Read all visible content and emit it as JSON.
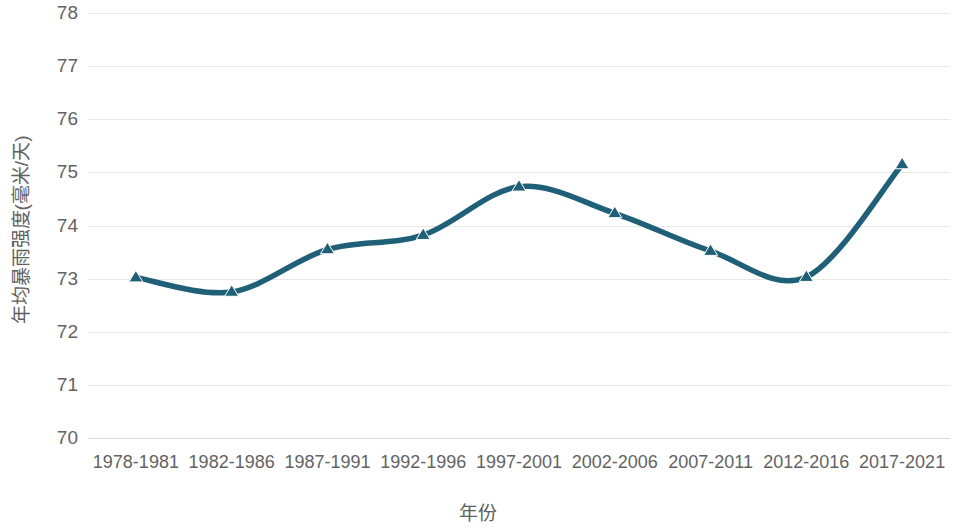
{
  "chart_data": {
    "type": "line",
    "title": "",
    "subtitle": "",
    "xlabel": "年份",
    "ylabel": "年均暴雨强度(毫米/天)",
    "categories": [
      "1978-1981",
      "1982-1986",
      "1987-1991",
      "1992-1996",
      "1997-2001",
      "2002-2006",
      "2007-2011",
      "2012-2016",
      "2017-2021"
    ],
    "values": [
      73.02,
      72.75,
      73.55,
      73.82,
      74.73,
      74.23,
      73.52,
      73.03,
      75.15
    ],
    "series": [
      {
        "name": "年均暴雨强度",
        "values": [
          73.02,
          72.75,
          73.55,
          73.82,
          74.73,
          74.23,
          73.52,
          73.03,
          75.15
        ]
      }
    ],
    "ylim": [
      70,
      78
    ],
    "xlim": [
      0,
      8
    ],
    "ytick_labels": [
      "78",
      "77",
      "76",
      "75",
      "74",
      "73",
      "72",
      "71",
      "70"
    ],
    "ytick_values": [
      78,
      77,
      76,
      75,
      74,
      73,
      72,
      71,
      70
    ],
    "grid": true,
    "grid_axis": "y",
    "legend": false,
    "legend_position": "none",
    "marker": "triangle-up",
    "line_color": "#1F5F77",
    "marker_color": "#1F5F77",
    "grid_color": "#E8E8E8",
    "axis_text_color": "#636363",
    "smoothing": true,
    "annotations": []
  }
}
